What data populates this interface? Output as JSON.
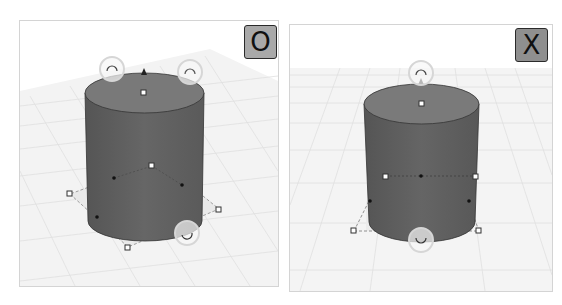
{
  "panels": [
    {
      "id": "left",
      "badge": {
        "label": "O",
        "meaning": "correct",
        "color": "#a9a9a9"
      },
      "view": "perspective",
      "object": "cylinder",
      "handles": {
        "rotate_handles": [
          "top-left",
          "top-right",
          "bottom-right"
        ],
        "height_arrow": "top",
        "corner_handles": 3,
        "center_handles": 2
      }
    },
    {
      "id": "right",
      "badge": {
        "label": "X",
        "meaning": "incorrect",
        "color": "#8f8f8f"
      },
      "view": "front",
      "object": "cylinder",
      "handles": {
        "rotate_handles": [
          "top",
          "bottom"
        ],
        "height_arrow": "top",
        "corner_handles": 2,
        "side_handles": 2,
        "center_handles": 1
      }
    }
  ],
  "colors": {
    "cylinder_side": "#5c5c5c",
    "cylinder_top": "#7a7a7a",
    "grid_line": "#e2e2e2",
    "ground": "#f4f4f4",
    "handle_ring": "#d8d8d8"
  }
}
